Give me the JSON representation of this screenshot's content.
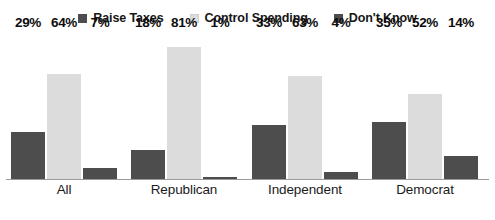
{
  "chart_data": {
    "type": "bar",
    "title": "",
    "subtitle": "",
    "xlabel": "",
    "ylabel": "",
    "ylim": [
      0,
      90
    ],
    "grid": false,
    "legend_position": "top-center",
    "value_suffix": "%",
    "categories": [
      "All",
      "Republican",
      "Independent",
      "Democrat"
    ],
    "series": [
      {
        "name": "Raise Taxes",
        "color": "#4d4d4d",
        "values": [
          29,
          18,
          33,
          35
        ],
        "labels": [
          "29%",
          "18%",
          "33%",
          "35%"
        ]
      },
      {
        "name": "Control Spending",
        "color": "#dcdcdc",
        "values": [
          64,
          81,
          63,
          52
        ],
        "labels": [
          "64%",
          "81%",
          "63%",
          "52%"
        ]
      },
      {
        "name": "Don't Know",
        "color": "#4d4d4d",
        "values": [
          7,
          1,
          4,
          14
        ],
        "labels": [
          "7%",
          "1%",
          "4%",
          "14%"
        ]
      }
    ]
  },
  "legend": {
    "items": [
      {
        "label": "Raise Taxes",
        "swatch_color": "#4d4d4d",
        "icon": "square-swatch-icon"
      },
      {
        "label": "Control Spending",
        "swatch_color": "#dcdcdc",
        "icon": "square-swatch-icon"
      },
      {
        "label": "Don't Know",
        "swatch_color": "#4d4d4d",
        "icon": "square-swatch-icon"
      }
    ]
  },
  "axis": {
    "baseline_color": "#9a9a9a"
  }
}
